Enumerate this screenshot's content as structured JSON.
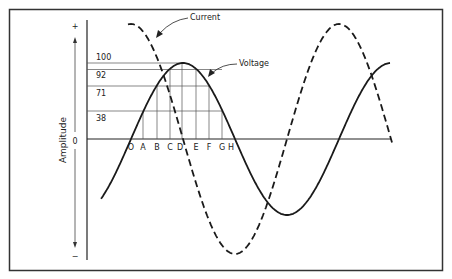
{
  "figure": {
    "axis_label": "Amplitude",
    "axis_plus": "+",
    "axis_zero": "0",
    "axis_minus": "−",
    "amplitude_ticks": [
      "100",
      "92",
      "71",
      "38"
    ],
    "point_labels": [
      "O",
      "A",
      "B",
      "C",
      "D",
      "E",
      "F",
      "G",
      "H"
    ],
    "callouts": {
      "current": "Current",
      "voltage": "Voltage"
    },
    "series": [
      {
        "name": "Voltage",
        "style": "solid",
        "relative_amplitude": 76,
        "phase": "reference"
      },
      {
        "name": "Current",
        "style": "dashed",
        "relative_amplitude": 115,
        "phase": "leads voltage by 90°"
      }
    ],
    "colors": {
      "line": "#222222",
      "grid": "#555555",
      "border": "#333333",
      "background": "#ffffff"
    }
  }
}
